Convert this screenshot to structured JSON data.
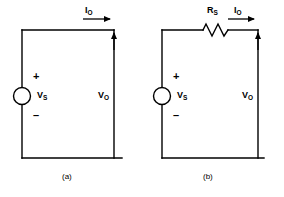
{
  "figure": {
    "background_color": "#ffffff",
    "line_color": "#000000"
  },
  "circuits": [
    {
      "id": "a",
      "caption": "(a)",
      "description": "Ideal voltage source with open-circuit output",
      "source": {
        "label_main": "V",
        "label_sub": "S",
        "plus_sign": "+",
        "minus_sign": "–",
        "symbol": "voltage-source-circle"
      },
      "output_voltage": {
        "label_main": "V",
        "label_sub": "O"
      },
      "output_current": {
        "label_main": "I",
        "label_sub": "O"
      },
      "has_series_resistor": false
    },
    {
      "id": "b",
      "caption": "(b)",
      "description": "Practical voltage source with series resistance",
      "source": {
        "label_main": "V",
        "label_sub": "S",
        "plus_sign": "+",
        "minus_sign": "–",
        "symbol": "voltage-source-circle"
      },
      "series_resistor": {
        "label_main": "R",
        "label_sub": "S",
        "symbol": "resistor-zigzag"
      },
      "output_voltage": {
        "label_main": "V",
        "label_sub": "O"
      },
      "output_current": {
        "label_main": "I",
        "label_sub": "O"
      },
      "has_series_resistor": true
    }
  ]
}
